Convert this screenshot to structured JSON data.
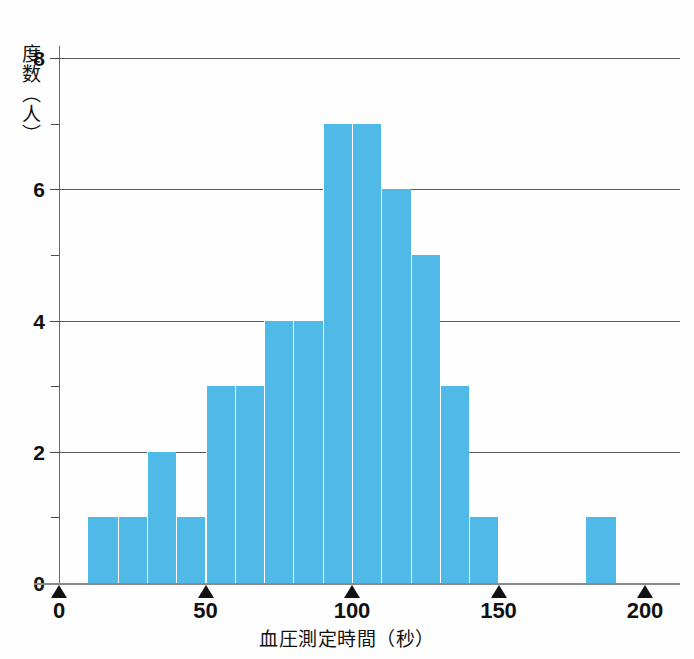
{
  "chart_data": {
    "type": "bar",
    "title": "",
    "xlabel": "血圧測定時間（秒）",
    "ylabel": "度数（人）",
    "xlim": [
      0,
      200
    ],
    "ylim": [
      0,
      8
    ],
    "grid": "horizontal-major",
    "legend": "none",
    "bin_width": 10,
    "bar_color": "#4fb9e8",
    "categories": [
      "10-20",
      "20-30",
      "30-40",
      "40-50",
      "50-60",
      "60-70",
      "70-80",
      "80-90",
      "90-100",
      "100-110",
      "110-120",
      "120-130",
      "130-140",
      "140-150",
      "150-160",
      "160-170",
      "170-180",
      "180-190"
    ],
    "bin_starts": [
      10,
      20,
      30,
      40,
      50,
      60,
      70,
      80,
      90,
      100,
      110,
      120,
      130,
      140,
      150,
      160,
      170,
      180
    ],
    "values": [
      1,
      1,
      2,
      1,
      3,
      3,
      4,
      4,
      7,
      7,
      6,
      5,
      3,
      1,
      0,
      0,
      0,
      1
    ],
    "x_ticks": [
      "0",
      "50",
      "100",
      "150",
      "200"
    ],
    "x_tick_values": [
      0,
      50,
      100,
      150,
      200
    ],
    "y_ticks_major": [
      "0",
      "2",
      "4",
      "6",
      "8"
    ],
    "y_tick_major_values": [
      0,
      2,
      4,
      6,
      8
    ],
    "y_tick_minor_values": [
      1,
      3,
      5,
      7
    ]
  },
  "axis": {
    "y_title": "度数（人）",
    "x_title": "血圧測定時間（秒）"
  }
}
